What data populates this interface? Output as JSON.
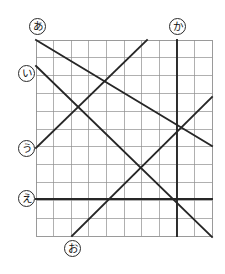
{
  "figure": {
    "kind": "grid-with-lines-diagram",
    "background_color": "#ffffff",
    "grid": {
      "left": 36,
      "top": 40,
      "right": 212,
      "bottom": 236,
      "columns": 10,
      "rows": 11,
      "cell_width": 17.6,
      "cell_height": 17.82,
      "minor_line_color": "#8f8f8f",
      "border_color": "#8f8f8f",
      "minor_line_width": 0.7,
      "border_width": 0.9
    },
    "line_color": "#262626",
    "line_width": 1.9,
    "labels": [
      {
        "id": "label-a",
        "text": "あ",
        "name": "line-label-a",
        "x": 29,
        "y": 18,
        "anchor_line": "line-a"
      },
      {
        "id": "label-i",
        "text": "い",
        "name": "line-label-i",
        "x": 18,
        "y": 65,
        "anchor_line": "line-i"
      },
      {
        "id": "label-u",
        "text": "う",
        "name": "line-label-u",
        "x": 18,
        "y": 140,
        "anchor_line": "line-u"
      },
      {
        "id": "label-e",
        "text": "え",
        "name": "line-label-e",
        "x": 18,
        "y": 190,
        "anchor_line": "line-e"
      },
      {
        "id": "label-o",
        "text": "お",
        "name": "line-label-o",
        "x": 64,
        "y": 240,
        "anchor_line": "line-o"
      },
      {
        "id": "label-ka",
        "text": "か",
        "name": "line-label-ka",
        "x": 169,
        "y": 18,
        "anchor_line": "line-ka"
      }
    ],
    "lines": [
      {
        "id": "line-a",
        "name": "diagonal-line-a",
        "label": "あ",
        "x1": 36,
        "y1": 40,
        "x2": 212,
        "y2": 146
      },
      {
        "id": "line-i",
        "name": "diagonal-line-i",
        "label": "い",
        "x1": 36,
        "y1": 66,
        "x2": 212,
        "y2": 237
      },
      {
        "id": "line-u",
        "name": "diagonal-line-u",
        "label": "う",
        "x1": 36,
        "y1": 148,
        "x2": 147,
        "y2": 40
      },
      {
        "id": "line-e",
        "name": "horizontal-line-e",
        "label": "え",
        "x1": 36,
        "y1": 199,
        "x2": 212,
        "y2": 199
      },
      {
        "id": "line-o",
        "name": "diagonal-line-o",
        "label": "お",
        "x1": 72,
        "y1": 236,
        "x2": 212,
        "y2": 97
      },
      {
        "id": "line-ka",
        "name": "vertical-line-ka",
        "label": "か",
        "x1": 177,
        "y1": 40,
        "x2": 177,
        "y2": 236
      }
    ]
  }
}
